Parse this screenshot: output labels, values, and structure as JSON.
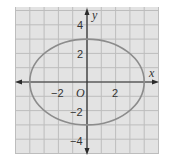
{
  "chart_data": {
    "type": "line",
    "title": "",
    "xlabel": "x",
    "ylabel": "y",
    "origin_label": "O",
    "xlim": [
      -5,
      5
    ],
    "ylim": [
      -5,
      5.25
    ],
    "grid": true,
    "grid_step": 1,
    "x_ticks_labeled": [
      -2,
      2
    ],
    "y_ticks_labeled": [
      4,
      2,
      -2,
      -4
    ],
    "tick_labels": {
      "x_neg2": "−2",
      "x_2": "2",
      "y_4": "4",
      "y_2": "2",
      "y_neg2": "−2",
      "y_neg4": "−4"
    },
    "series": [
      {
        "name": "ellipse",
        "equation": "x^2/16 + y^2/9 = 1",
        "center": [
          0,
          0
        ],
        "semi_major_x": 4,
        "semi_minor_y": 3,
        "vertices": [
          [
            -4,
            0
          ],
          [
            4,
            0
          ]
        ],
        "co_vertices": [
          [
            0,
            3
          ],
          [
            0,
            -3
          ]
        ]
      }
    ],
    "colors": {
      "background": "#e3e3e3",
      "grid": "#bdbdbd",
      "axis": "#2b2b2b",
      "curve": "#8c8c8c"
    }
  }
}
